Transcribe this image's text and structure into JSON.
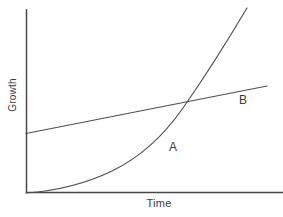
{
  "figure": {
    "y_axis_label": "Growth",
    "x_axis_label": "Time",
    "curve_a_label": "A",
    "curve_b_label": "B"
  },
  "colors": {
    "background": "#ffffff",
    "line_stroke": "#474747",
    "text": "#3a3a3a"
  },
  "chart_data": {
    "type": "line",
    "title": "",
    "xlabel": "Time",
    "ylabel": "Growth",
    "axes_have_numeric_ticks": false,
    "grid": false,
    "legend": "inline labels next to curves",
    "xlim": [
      0,
      10
    ],
    "ylim": [
      0,
      10
    ],
    "series": [
      {
        "name": "A",
        "shape": "exponential",
        "label_position_near": [
          6.0,
          2.5
        ],
        "points": [
          [
            0,
            0
          ],
          [
            1.3,
            0.2
          ],
          [
            2.5,
            0.7
          ],
          [
            3.7,
            1.5
          ],
          [
            4.6,
            2.5
          ],
          [
            5.4,
            3.6
          ],
          [
            6.2,
            4.9
          ],
          [
            7.0,
            6.4
          ],
          [
            7.7,
            8.1
          ],
          [
            8.6,
            10.1
          ]
        ],
        "path_px": "M26,193 C55,191 85,184 112,171 C139,158 162,138 183,108 C204,78 228,40 247,8"
      },
      {
        "name": "B",
        "shape": "linear",
        "label_position_near": [
          8.4,
          4.6
        ],
        "points": [
          [
            0,
            3.3
          ],
          [
            9.4,
            5.9
          ]
        ],
        "path_px": "M26,133.5 L267,86"
      }
    ],
    "intersection_point": [
      6.3,
      5.0
    ],
    "axes_path_px": "M26.5,10 L26.5,192.5 L283,192.5"
  }
}
